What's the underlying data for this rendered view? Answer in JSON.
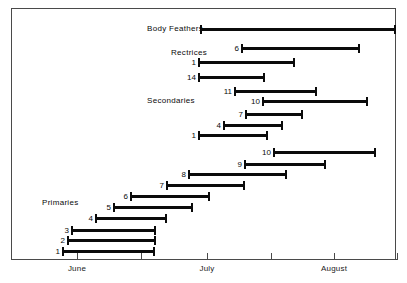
{
  "chart_data": {
    "type": "bar",
    "orientation": "horizontal-range",
    "title": "",
    "subtitle": "",
    "xlabel": "",
    "ylabel": "",
    "grid": false,
    "legend": "none",
    "x_axis": {
      "tick_labels": [
        "",
        "June",
        "",
        "July",
        "",
        "August",
        ""
      ],
      "tick_positions_px": [
        11,
        77,
        141,
        207,
        271,
        334,
        397
      ],
      "range_months": [
        "June",
        "July",
        "August"
      ]
    },
    "group_labels": [
      {
        "text": "Body Feathers",
        "x": 147,
        "y": 24
      },
      {
        "text": "Rectrices",
        "x": 171,
        "y": 48
      },
      {
        "text": "Secondaries",
        "x": 147,
        "y": 96
      },
      {
        "text": "Primaries",
        "x": 42,
        "y": 198
      }
    ],
    "bars": [
      {
        "label": "",
        "group": "Body Feathers",
        "y": 25,
        "start_px": 200,
        "end_px": 396
      },
      {
        "label": "6",
        "group": "Rectrices",
        "y": 44,
        "start_px": 241,
        "end_px": 360
      },
      {
        "label": "1",
        "group": "Rectrices",
        "y": 58,
        "start_px": 198,
        "end_px": 295
      },
      {
        "label": "14",
        "group": "Rectrices",
        "y": 73,
        "start_px": 198,
        "end_px": 265
      },
      {
        "label": "11",
        "group": "Secondaries",
        "y": 87,
        "start_px": 234,
        "end_px": 317
      },
      {
        "label": "10",
        "group": "Secondaries",
        "y": 97,
        "start_px": 262,
        "end_px": 368
      },
      {
        "label": "7",
        "group": "Secondaries",
        "y": 110,
        "start_px": 245,
        "end_px": 303
      },
      {
        "label": "4",
        "group": "Secondaries",
        "y": 121,
        "start_px": 223,
        "end_px": 283
      },
      {
        "label": "1",
        "group": "Secondaries",
        "y": 131,
        "start_px": 198,
        "end_px": 268
      },
      {
        "label": "10",
        "group": "Primaries",
        "y": 148,
        "start_px": 273,
        "end_px": 376
      },
      {
        "label": "9",
        "group": "Primaries",
        "y": 160,
        "start_px": 244,
        "end_px": 326
      },
      {
        "label": "8",
        "group": "Primaries",
        "y": 170,
        "start_px": 188,
        "end_px": 287
      },
      {
        "label": "7",
        "group": "Primaries",
        "y": 181,
        "start_px": 166,
        "end_px": 245
      },
      {
        "label": "6",
        "group": "Primaries",
        "y": 192,
        "start_px": 130,
        "end_px": 210
      },
      {
        "label": "5",
        "group": "Primaries",
        "y": 203,
        "start_px": 113,
        "end_px": 193
      },
      {
        "label": "4",
        "group": "Primaries",
        "y": 214,
        "start_px": 95,
        "end_px": 167
      },
      {
        "label": "3",
        "group": "Primaries",
        "y": 226,
        "start_px": 71,
        "end_px": 156
      },
      {
        "label": "2",
        "group": "Primaries",
        "y": 236,
        "start_px": 67,
        "end_px": 156
      },
      {
        "label": "1",
        "group": "Primaries",
        "y": 247,
        "start_px": 62,
        "end_px": 155
      }
    ],
    "colors": {
      "bar": "#0b0b0b",
      "frame": "#4a4a4a",
      "text": "#0a0a0a",
      "background": "#ffffff"
    }
  }
}
